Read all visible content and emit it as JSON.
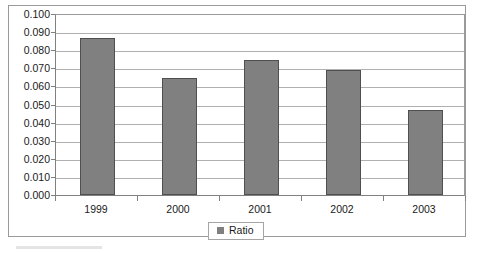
{
  "chart_data": {
    "type": "bar",
    "title": "",
    "subtitle": "",
    "xlabel": "",
    "ylabel": "",
    "categories": [
      "1999",
      "2000",
      "2001",
      "2002",
      "2003"
    ],
    "series": [
      {
        "name": "Ratio",
        "color": "#808080",
        "values": [
          0.087,
          0.0645,
          0.0745,
          0.069,
          0.047
        ]
      }
    ],
    "ylim": [
      0.0,
      0.1
    ],
    "ytick_step": 0.01,
    "ytick_labels": [
      "0.100",
      "0.090",
      "0.080",
      "0.070",
      "0.060",
      "0.050",
      "0.040",
      "0.030",
      "0.020",
      "0.010",
      "0.000"
    ],
    "grid": true,
    "grid_axis": "y",
    "legend": true,
    "legend_position": "bottom",
    "legend_entries": [
      "Ratio"
    ]
  },
  "colors": {
    "bar_fill": "#808080",
    "bar_outline": "#4f4f4f",
    "gridline": "#b0b0b0",
    "axis": "#808080",
    "frame": "#9a9a9a",
    "text": "#1a1a1a",
    "background": "#ffffff"
  }
}
